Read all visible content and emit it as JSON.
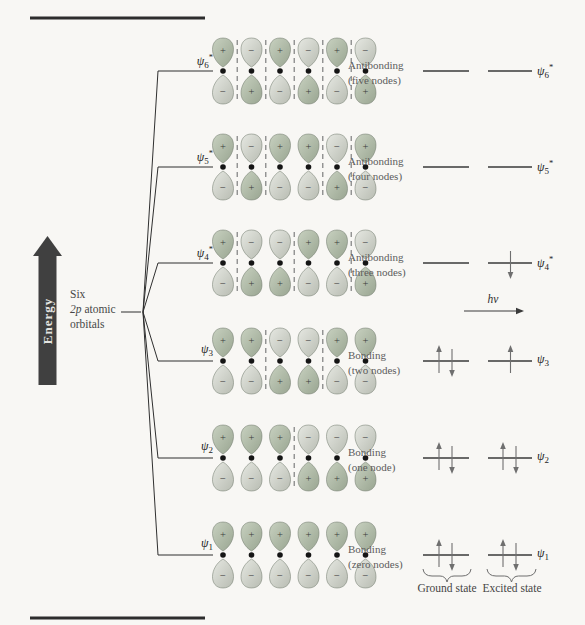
{
  "figure": {
    "energy_axis": {
      "label": "Energy"
    },
    "source_orbitals": {
      "line1": "Six",
      "line2_italic": "2p",
      "line2_rest": " atomic",
      "line3": "orbitals"
    },
    "transition": {
      "h": "h",
      "nu": "ν"
    },
    "states": {
      "ground": {
        "label": "Ground state"
      },
      "excited": {
        "label": "Excited state"
      }
    }
  },
  "orbitals": [
    {
      "psi": "ψ",
      "sub": "6",
      "star": "*",
      "type": "Antibonding",
      "nodes": "(five nodes)",
      "top_signs": [
        "+",
        "−",
        "+",
        "−",
        "+",
        "−"
      ],
      "bottom_signs": [
        "−",
        "+",
        "−",
        "+",
        "−",
        "+"
      ],
      "node_lines_after": [
        1,
        2,
        3,
        4,
        5
      ],
      "ground_electrons": [],
      "excited_electrons": []
    },
    {
      "psi": "ψ",
      "sub": "5",
      "star": "*",
      "type": "Antibonding",
      "nodes": "(four nodes)",
      "top_signs": [
        "+",
        "−",
        "+",
        "+",
        "−",
        "+"
      ],
      "bottom_signs": [
        "−",
        "+",
        "−",
        "−",
        "+",
        "−"
      ],
      "node_lines_after": [
        1,
        2,
        4,
        5
      ],
      "ground_electrons": [],
      "excited_electrons": []
    },
    {
      "psi": "ψ",
      "sub": "4",
      "star": "*",
      "type": "Antibonding",
      "nodes": "(three nodes)",
      "top_signs": [
        "+",
        "−",
        "−",
        "+",
        "+",
        "−"
      ],
      "bottom_signs": [
        "−",
        "+",
        "+",
        "−",
        "−",
        "+"
      ],
      "node_lines_after": [
        1,
        3,
        5
      ],
      "ground_electrons": [],
      "excited_electrons": [
        "down"
      ]
    },
    {
      "psi": "ψ",
      "sub": "3",
      "star": "",
      "type": "Bonding",
      "nodes": "(two nodes)",
      "top_signs": [
        "+",
        "+",
        "−",
        "−",
        "+",
        "+"
      ],
      "bottom_signs": [
        "−",
        "−",
        "+",
        "+",
        "−",
        "−"
      ],
      "node_lines_after": [
        2,
        4
      ],
      "ground_electrons": [
        "up",
        "down"
      ],
      "excited_electrons": [
        "up"
      ]
    },
    {
      "psi": "ψ",
      "sub": "2",
      "star": "",
      "type": "Bonding",
      "nodes": "(one node)",
      "top_signs": [
        "+",
        "+",
        "+",
        "−",
        "−",
        "−"
      ],
      "bottom_signs": [
        "−",
        "−",
        "−",
        "+",
        "+",
        "+"
      ],
      "node_lines_after": [
        3
      ],
      "ground_electrons": [
        "up",
        "down"
      ],
      "excited_electrons": [
        "up",
        "down"
      ]
    },
    {
      "psi": "ψ",
      "sub": "1",
      "star": "",
      "type": "Bonding",
      "nodes": "(zero nodes)",
      "top_signs": [
        "+",
        "+",
        "+",
        "+",
        "+",
        "+"
      ],
      "bottom_signs": [
        "−",
        "−",
        "−",
        "−",
        "−",
        "−"
      ],
      "node_lines_after": [],
      "ground_electrons": [
        "up",
        "down"
      ],
      "excited_electrons": [
        "up",
        "down"
      ]
    }
  ],
  "colors": {
    "line": "#2f2f2f",
    "bar": "#2d2d2d",
    "dashed_node": "#8f8f8f",
    "lobe_plus_light": "#c8d1c0",
    "lobe_plus_dark": "#99a591",
    "lobe_minus_light": "#e6e8e2",
    "lobe_minus_dark": "#b8bcb2",
    "electron_arrow": "#6f6f6f",
    "energy_arrow": "#404040",
    "sign_text": "#3c3c3c"
  }
}
